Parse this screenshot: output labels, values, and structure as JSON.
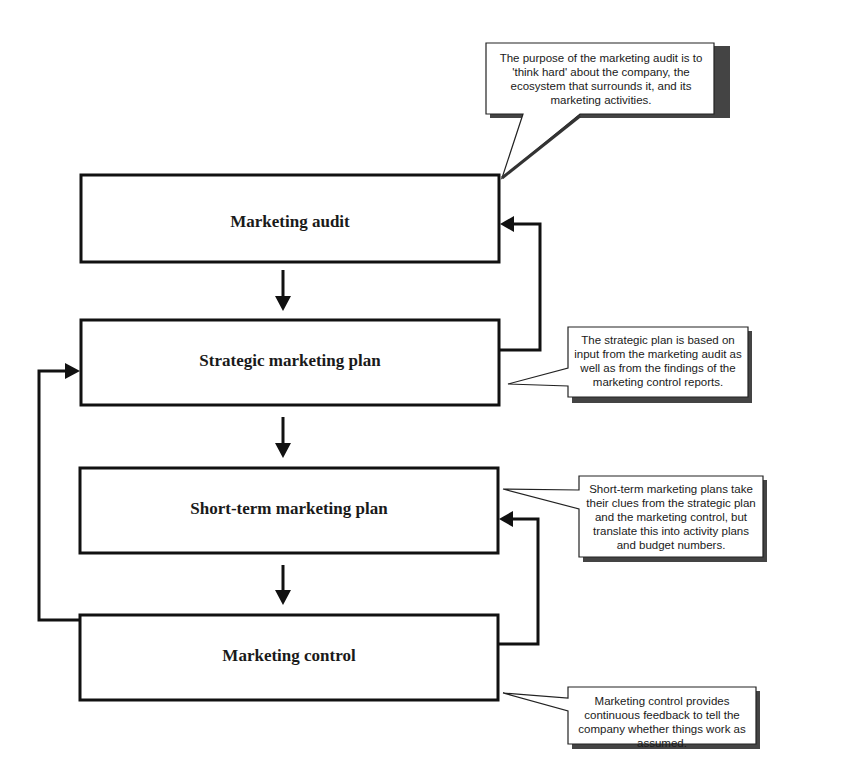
{
  "diagram": {
    "boxes": [
      {
        "id": "audit",
        "label": "Marketing audit"
      },
      {
        "id": "strategic",
        "label": "Strategic marketing plan"
      },
      {
        "id": "shortterm",
        "label": "Short-term marketing plan"
      },
      {
        "id": "control",
        "label": "Marketing control"
      }
    ],
    "flows": [
      {
        "from": "audit",
        "to": "strategic",
        "type": "down-arrow"
      },
      {
        "from": "strategic",
        "to": "shortterm",
        "type": "down-arrow"
      },
      {
        "from": "shortterm",
        "to": "control",
        "type": "down-arrow"
      },
      {
        "from": "strategic",
        "to": "audit",
        "type": "feedback-right"
      },
      {
        "from": "control",
        "to": "shortterm",
        "type": "feedback-right"
      },
      {
        "from": "control",
        "to": "strategic",
        "type": "feedback-left"
      }
    ],
    "callouts": [
      {
        "target": "audit",
        "text": "The purpose of the marketing audit is to 'think hard' about the company, the ecosystem that surrounds it, and its marketing activities."
      },
      {
        "target": "strategic",
        "text": "The strategic plan is based on input from the marketing audit as well as from the findings of the marketing control reports."
      },
      {
        "target": "shortterm",
        "text": "Short-term marketing plans take their clues from the strategic plan and the marketing control, but translate this into activity plans and budget numbers."
      },
      {
        "target": "control",
        "text": "Marketing control provides continuous feedback to tell the company whether things work as assumed."
      }
    ]
  }
}
